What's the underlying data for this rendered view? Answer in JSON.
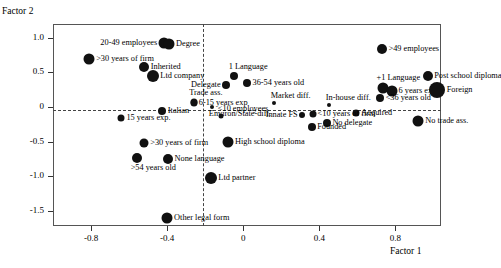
{
  "chart_data": {
    "type": "scatter",
    "title": "",
    "xlabel": "Factor 1",
    "ylabel": "Factor 2",
    "xlim": [
      -1.0,
      1.04
    ],
    "ylim": [
      -1.72,
      1.2
    ],
    "grid": false,
    "legend": "none",
    "xticks": [
      -0.8,
      -0.4,
      0,
      0.4,
      0.8
    ],
    "xticklabels": [
      "-0.8",
      "-0.4",
      "0",
      "0.4",
      "0.8"
    ],
    "yticks": [
      1.0,
      0.5,
      0,
      -0.5,
      -1.0,
      -1.5
    ],
    "yticklabels": [
      "1.0",
      "0.5",
      "0",
      "-0.5",
      "-1.0",
      "-1.5"
    ],
    "reference_lines": {
      "vertical_x": 0,
      "horizontal_y": 0,
      "style": "dashed"
    },
    "points": [
      {
        "label": "20-49 employees",
        "x": -0.415,
        "y": 0.925,
        "size": 11,
        "lpos": "left"
      },
      {
        "label": "Degree",
        "x": -0.39,
        "y": 0.915,
        "size": 11,
        "lpos": "right"
      },
      {
        "label": ">49 employees",
        "x": 0.73,
        "y": 0.845,
        "size": 10,
        "lpos": "right"
      },
      {
        "label": ">30 years of firm",
        "x": -0.81,
        "y": 0.69,
        "size": 11,
        "lpos": "right"
      },
      {
        "label": "Inherited",
        "x": -0.52,
        "y": 0.585,
        "size": 10,
        "lpos": "right"
      },
      {
        "label": "Ltd company",
        "x": -0.475,
        "y": 0.455,
        "size": 12,
        "lpos": "right"
      },
      {
        "label": "1 Language",
        "x": -0.05,
        "y": 0.455,
        "size": 8,
        "lpos": "above"
      },
      {
        "label": "+1 Language",
        "x": 0.735,
        "y": 0.27,
        "size": 11,
        "lpos": "above"
      },
      {
        "label": "Post school diploma",
        "x": 0.97,
        "y": 0.455,
        "size": 10,
        "lpos": "right"
      },
      {
        "label": "36-54 years old",
        "x": 0.02,
        "y": 0.345,
        "size": 8,
        "lpos": "right"
      },
      {
        "label": "Delegate",
        "x": -0.09,
        "y": 0.32,
        "size": 8,
        "lpos": "left"
      },
      {
        "label": "6 years exp",
        "x": 0.78,
        "y": 0.235,
        "size": 11,
        "lpos": "right"
      },
      {
        "label": "Foreign",
        "x": 1.02,
        "y": 0.24,
        "size": 16,
        "lpos": "right"
      },
      {
        "label": "Market diff.",
        "x": 0.16,
        "y": 0.06,
        "size": 4,
        "lpos": "above"
      },
      {
        "label": "In-house diff.",
        "x": 0.45,
        "y": 0.035,
        "size": 4,
        "lpos": "above"
      },
      {
        "label": "Trade ass.",
        "x": -0.26,
        "y": 0.075,
        "size": 7,
        "lpos": "above"
      },
      {
        "label": "6-15 years exp",
        "x": -0.26,
        "y": 0.065,
        "size": 7,
        "lpos": "right"
      },
      {
        "label": "<36 years old",
        "x": 0.72,
        "y": 0.125,
        "size": 8,
        "lpos": "right"
      },
      {
        "label": "Environ/State-diff.",
        "x": -0.165,
        "y": 0.0,
        "size": 4,
        "lpos": "below"
      },
      {
        "label": "Acquired",
        "x": 0.595,
        "y": -0.09,
        "size": 7,
        "lpos": "right"
      },
      {
        "label": "No trade ass.",
        "x": 0.92,
        "y": -0.2,
        "size": 11,
        "lpos": "right"
      },
      {
        "label": "Italian",
        "x": -0.425,
        "y": -0.055,
        "size": 8,
        "lpos": "right"
      },
      {
        "label": "Innate FS",
        "x": 0.31,
        "y": -0.11,
        "size": 6,
        "lpos": "left"
      },
      {
        "label": "<10 years of firm",
        "x": 0.365,
        "y": -0.095,
        "size": 7,
        "lpos": "right"
      },
      {
        "label": "<10 employees",
        "x": -0.115,
        "y": -0.13,
        "size": 5,
        "lpos": "above"
      },
      {
        "label": "15 years exp.",
        "x": -0.64,
        "y": -0.165,
        "size": 7,
        "lpos": "right"
      },
      {
        "label": "No delegate",
        "x": 0.44,
        "y": -0.23,
        "size": 8,
        "lpos": "right"
      },
      {
        "label": "Founded",
        "x": 0.36,
        "y": -0.285,
        "size": 8,
        "lpos": "right"
      },
      {
        "label": "High school diploma",
        "x": -0.08,
        "y": -0.5,
        "size": 11,
        "lpos": "right"
      },
      {
        "label": ">30 years of firm",
        "x": -0.52,
        "y": -0.52,
        "size": 9,
        "lpos": "right"
      },
      {
        "label": ">54 years old",
        "x": -0.56,
        "y": -0.735,
        "size": 10,
        "lpos": "below"
      },
      {
        "label": "None language",
        "x": -0.395,
        "y": -0.745,
        "size": 10,
        "lpos": "right"
      },
      {
        "label": "Ltd partner",
        "x": -0.17,
        "y": -1.03,
        "size": 12,
        "lpos": "right"
      },
      {
        "label": "Other legal form",
        "x": -0.4,
        "y": -1.6,
        "size": 11,
        "lpos": "right"
      }
    ]
  }
}
